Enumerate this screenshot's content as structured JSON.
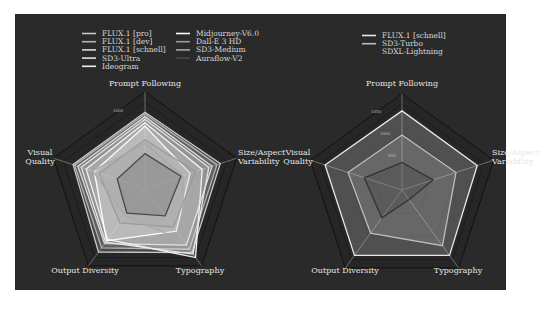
{
  "chart_data": [
    {
      "type": "radar",
      "title": "",
      "axes": [
        "Prompt Following",
        "Size/Aspect Variability",
        "Typography",
        "Output Diversity",
        "Visual Quality"
      ],
      "axis_label_lines": [
        [
          "Prompt Following"
        ],
        [
          "Size/Aspect",
          "Variability"
        ],
        [
          "Typography"
        ],
        [
          "Output Diversity"
        ],
        [
          "Visual",
          "Quality"
        ]
      ],
      "tick_labels": [
        "1000"
      ],
      "grid_levels": 3,
      "legend_position": "top-left",
      "series": [
        {
          "name": "FLUX.1 [pro]",
          "color": "#c8c8c8",
          "values": [
            0.88,
            0.92,
            0.93,
            0.92,
            0.88
          ]
        },
        {
          "name": "FLUX.1 [dev]",
          "color": "#b4b4b4",
          "values": [
            0.86,
            0.88,
            0.88,
            0.86,
            0.86
          ]
        },
        {
          "name": "FLUX.1 [schnell]",
          "color": "#dcdcdc",
          "values": [
            0.83,
            0.82,
            0.82,
            0.8,
            0.82
          ]
        },
        {
          "name": "SD3-Ultra",
          "color": "#e4e4e4",
          "values": [
            0.8,
            0.78,
            0.95,
            0.78,
            0.78
          ]
        },
        {
          "name": "Ideogram",
          "color": "#f0f0f0",
          "values": [
            0.76,
            0.7,
            1.0,
            0.74,
            0.72
          ]
        },
        {
          "name": "Midjourney-V6.0",
          "color": "#ffffff",
          "values": [
            0.72,
            0.55,
            0.62,
            0.76,
            0.62
          ]
        },
        {
          "name": "Dall-E 3 HD",
          "color": "#9a9a9a",
          "values": [
            0.56,
            0.62,
            0.56,
            0.5,
            0.56
          ]
        },
        {
          "name": "SD3-Medium",
          "color": "#a8a8a8",
          "values": [
            0.52,
            0.46,
            0.76,
            0.4,
            0.64
          ]
        },
        {
          "name": "Auraflow-V2",
          "color": "#4a4a4a",
          "values": [
            0.4,
            0.44,
            0.4,
            0.36,
            0.34
          ]
        }
      ]
    },
    {
      "type": "radar",
      "title": "",
      "axes": [
        "Prompt Following",
        "Size/Aspect Variability",
        "Typography",
        "Output Diversity",
        "Visual Quality"
      ],
      "axis_label_lines": [
        [
          "Prompt Following"
        ],
        [
          "Size/Aspect",
          "Variability"
        ],
        [
          "Typography"
        ],
        [
          "Output Diversity"
        ],
        [
          "Visual",
          "Quality"
        ]
      ],
      "tick_labels": [
        "1050",
        "1000",
        "950"
      ],
      "grid_levels": 3,
      "legend_position": "top-center",
      "series": [
        {
          "name": "FLUX.1 [schnell]",
          "color": "#e8e8e8",
          "values": [
            0.92,
            0.92,
            0.94,
            0.94,
            0.94
          ]
        },
        {
          "name": "SD3-Turbo",
          "color": "#bcbcbc",
          "values": [
            0.64,
            0.66,
            0.8,
            0.62,
            0.66
          ]
        },
        {
          "name": "SDXL-Lightning",
          "color": "#333333",
          "values": [
            0.32,
            0.38,
            0.14,
            0.4,
            0.46
          ]
        }
      ]
    }
  ],
  "legends": {
    "left": {
      "col1": [
        "FLUX.1 [pro]",
        "FLUX.1 [dev]",
        "FLUX.1 [schnell]",
        "SD3-Ultra",
        "Ideogram"
      ],
      "col2": [
        "Midjourney-V6.0",
        "Dall-E 3 HD",
        "SD3-Medium",
        "Auraflow-V2"
      ]
    },
    "right": [
      "FLUX.1 [schnell]",
      "SD3-Turbo",
      "SDXL-Lightning"
    ]
  },
  "colors": {
    "panel_bg": "#2a2a2a",
    "grid": "#1a1a1a",
    "axis_line": "#8a8a8a",
    "label": "#e6e6e6"
  }
}
